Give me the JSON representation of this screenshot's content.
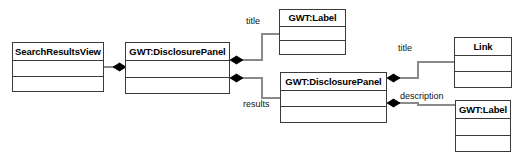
{
  "diagram": {
    "type": "uml-class-diagram",
    "width": 521,
    "height": 159,
    "background_color": "#ffffff",
    "line_color": "#8a8a8a",
    "border_color": "#3a3a3a",
    "diamond_color": "#000000",
    "classes": [
      {
        "id": "search-results-view",
        "name": "SearchResultsView",
        "x": 12,
        "y": 42,
        "width": 92,
        "height": 50,
        "name_height": 18,
        "attributes": [],
        "operations": []
      },
      {
        "id": "disclosure-panel-1",
        "name": "GWT:DisclosurePanel",
        "x": 125,
        "y": 42,
        "width": 105,
        "height": 52,
        "name_height": 18,
        "attributes": [],
        "operations": []
      },
      {
        "id": "label-top",
        "name": "GWT:Label",
        "x": 279,
        "y": 9,
        "width": 67,
        "height": 46,
        "name_height": 17,
        "attributes": [],
        "operations": []
      },
      {
        "id": "disclosure-panel-2",
        "name": "GWT:DisclosurePanel",
        "x": 280,
        "y": 72,
        "width": 107,
        "height": 51,
        "name_height": 18,
        "attributes": [],
        "operations": []
      },
      {
        "id": "link",
        "name": "Link",
        "x": 454,
        "y": 37,
        "width": 58,
        "height": 51,
        "name_height": 18,
        "attributes": [],
        "operations": []
      },
      {
        "id": "label-bottom",
        "name": "GWT:Label",
        "x": 455,
        "y": 100,
        "width": 56,
        "height": 52,
        "name_height": 18,
        "attributes": [],
        "operations": []
      }
    ],
    "associations": [
      {
        "id": "assoc-searchresults-panel1",
        "label": "",
        "source": "disclosure-panel-1",
        "target": "search-results-view",
        "composition_end": "source"
      },
      {
        "id": "assoc-panel1-title",
        "label": "title",
        "label_x": 246,
        "label_y": 22,
        "source": "disclosure-panel-1",
        "target": "label-top",
        "composition_end": "source"
      },
      {
        "id": "assoc-panel1-results",
        "label": "results",
        "label_x": 243,
        "label_y": 100,
        "source": "disclosure-panel-1",
        "target": "disclosure-panel-2",
        "composition_end": "source"
      },
      {
        "id": "assoc-panel2-title",
        "label": "title",
        "label_x": 398,
        "label_y": 42,
        "source": "disclosure-panel-2",
        "target": "link",
        "composition_end": "source"
      },
      {
        "id": "assoc-panel2-description",
        "label": "description",
        "label_x": 400,
        "label_y": 91,
        "source": "disclosure-panel-2",
        "target": "label-bottom",
        "composition_end": "source"
      }
    ]
  }
}
